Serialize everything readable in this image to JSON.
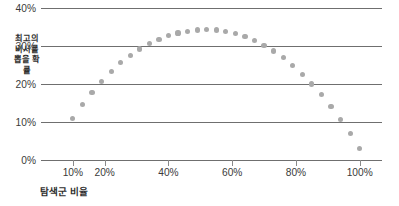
{
  "chart_data": {
    "type": "scatter",
    "title": "",
    "xlabel": "탐색군 비율",
    "ylabel": "최고의 비서를 뽑을 확률",
    "xlim": [
      0,
      107
    ],
    "ylim": [
      0,
      40
    ],
    "grid": true,
    "legend": false,
    "marker_color": "#a9a9a9",
    "axis_color": "#6f6f6f",
    "text_color": "#3a3a3a",
    "yticks": [
      {
        "value": 0,
        "label": "0%"
      },
      {
        "value": 10,
        "label": "10%"
      },
      {
        "value": 20,
        "label": "20%"
      },
      {
        "value": 30,
        "label": "30%"
      },
      {
        "value": 40,
        "label": "40%"
      }
    ],
    "xticks": [
      {
        "value": 10,
        "label": "10%"
      },
      {
        "value": 20,
        "label": "20%"
      },
      {
        "value": 40,
        "label": "40%"
      },
      {
        "value": 60,
        "label": "60%"
      },
      {
        "value": 80,
        "label": "80%"
      },
      {
        "value": 100,
        "label": "100%"
      }
    ],
    "x": [
      10,
      13,
      16,
      19,
      22,
      25,
      28,
      31,
      34,
      37,
      40,
      43,
      46,
      49,
      52,
      55,
      58,
      61,
      64,
      67,
      70,
      73,
      76,
      79,
      82,
      85,
      88,
      91,
      94,
      97,
      100
    ],
    "values": [
      11.0,
      14.5,
      17.8,
      20.7,
      23.3,
      25.6,
      27.5,
      29.2,
      30.6,
      31.8,
      32.7,
      33.4,
      33.9,
      34.2,
      34.3,
      34.2,
      33.9,
      33.3,
      32.5,
      31.5,
      30.2,
      28.7,
      26.9,
      24.9,
      22.6,
      20.0,
      17.2,
      14.1,
      10.7,
      7.0,
      3.0
    ],
    "series_name": "최고의 비서를 뽑을 확률",
    "annotation": ""
  }
}
